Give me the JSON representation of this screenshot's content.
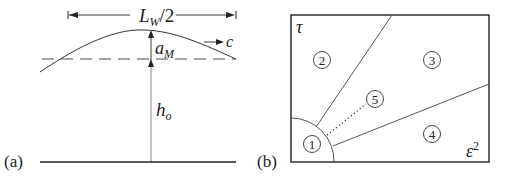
{
  "panel_a": {
    "tag": "(a)",
    "wavelength_label": "L",
    "wavelength_sub": "W",
    "wavelength_suffix": "/2",
    "amplitude_label": "a",
    "amplitude_sub": "M",
    "depth_label": "h",
    "depth_sub": "o",
    "speed_label": "c"
  },
  "panel_b": {
    "tag": "(b)",
    "y_axis_label": "τ",
    "x_axis_label": "ε",
    "x_axis_sup": "2",
    "regions": [
      {
        "id": "1",
        "label": "1"
      },
      {
        "id": "2",
        "label": "2"
      },
      {
        "id": "3",
        "label": "3"
      },
      {
        "id": "4",
        "label": "4"
      },
      {
        "id": "5",
        "label": "5"
      }
    ]
  },
  "colors": {
    "ink": "#222222",
    "background": "#ffffff"
  }
}
